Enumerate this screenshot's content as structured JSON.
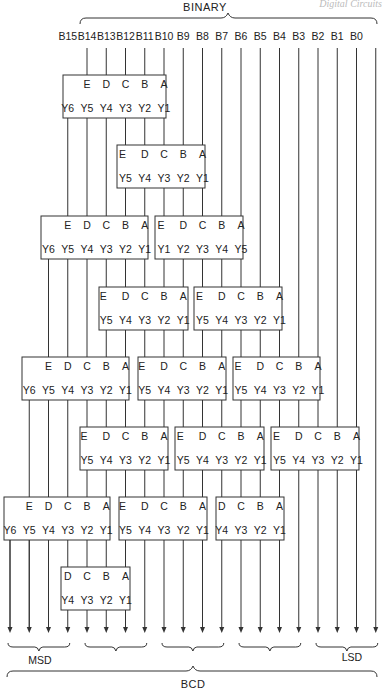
{
  "header": {
    "corner_text": "Digital Circuits",
    "top_brace_label": "BINARY",
    "bottom_brace_label": "BCD",
    "msd_label": "MSD",
    "lsd_label": "LSD"
  },
  "inputs": [
    "B15",
    "B14",
    "B13",
    "B12",
    "B11",
    "B10",
    "B9",
    "B8",
    "B7",
    "B6",
    "B5",
    "B4",
    "B3",
    "B2",
    "B1",
    "B0"
  ],
  "blocks": [
    {
      "id": "r1-a",
      "row": 1,
      "inputs": [
        "E",
        "D",
        "C",
        "B",
        "A"
      ],
      "outputs": [
        "Y6",
        "Y5",
        "Y4",
        "Y3",
        "Y2",
        "Y1"
      ]
    },
    {
      "id": "r2-a",
      "row": 2,
      "inputs": [
        "E",
        "D",
        "C",
        "B",
        "A"
      ],
      "outputs": [
        "Y5",
        "Y4",
        "Y3",
        "Y2",
        "Y1"
      ]
    },
    {
      "id": "r3-a",
      "row": 3,
      "inputs": [
        "E",
        "D",
        "C",
        "B",
        "A"
      ],
      "outputs": [
        "Y6",
        "Y5",
        "Y4",
        "Y3",
        "Y2",
        "Y1"
      ]
    },
    {
      "id": "r3-b",
      "row": 3,
      "inputs": [
        "E",
        "D",
        "C",
        "B",
        "A"
      ],
      "outputs": [
        "Y1",
        "Y2",
        "Y3",
        "Y4",
        "Y5"
      ]
    },
    {
      "id": "r4-a",
      "row": 4,
      "inputs": [
        "E",
        "D",
        "C",
        "B",
        "A"
      ],
      "outputs": [
        "Y5",
        "Y4",
        "Y3",
        "Y2",
        "Y1"
      ]
    },
    {
      "id": "r4-b",
      "row": 4,
      "inputs": [
        "E",
        "D",
        "C",
        "B",
        "A"
      ],
      "outputs": [
        "Y5",
        "Y4",
        "Y3",
        "Y2",
        "Y1"
      ]
    },
    {
      "id": "r5-a",
      "row": 5,
      "inputs": [
        "E",
        "D",
        "C",
        "B",
        "A"
      ],
      "outputs": [
        "Y6",
        "Y5",
        "Y4",
        "Y3",
        "Y2",
        "Y1"
      ]
    },
    {
      "id": "r5-b",
      "row": 5,
      "inputs": [
        "E",
        "D",
        "C",
        "B",
        "A"
      ],
      "outputs": [
        "Y5",
        "Y4",
        "Y3",
        "Y2",
        "Y1"
      ]
    },
    {
      "id": "r5-c",
      "row": 5,
      "inputs": [
        "E",
        "D",
        "C",
        "B",
        "A"
      ],
      "outputs": [
        "Y5",
        "Y4",
        "Y3",
        "Y2",
        "Y1"
      ]
    },
    {
      "id": "r6-a",
      "row": 6,
      "inputs": [
        "E",
        "D",
        "C",
        "B",
        "A"
      ],
      "outputs": [
        "Y5",
        "Y4",
        "Y3",
        "Y2",
        "Y1"
      ]
    },
    {
      "id": "r6-b",
      "row": 6,
      "inputs": [
        "E",
        "D",
        "C",
        "B",
        "A"
      ],
      "outputs": [
        "Y5",
        "Y4",
        "Y3",
        "Y2",
        "Y1"
      ]
    },
    {
      "id": "r6-c",
      "row": 6,
      "inputs": [
        "E",
        "D",
        "C",
        "B",
        "A"
      ],
      "outputs": [
        "Y5",
        "Y4",
        "Y3",
        "Y2",
        "Y1"
      ]
    },
    {
      "id": "r7-a",
      "row": 7,
      "inputs": [
        "E",
        "D",
        "C",
        "B",
        "A"
      ],
      "outputs": [
        "Y6",
        "Y5",
        "Y4",
        "Y3",
        "Y2",
        "Y1"
      ]
    },
    {
      "id": "r7-b",
      "row": 7,
      "inputs": [
        "E",
        "D",
        "C",
        "B",
        "A"
      ],
      "outputs": [
        "Y5",
        "Y4",
        "Y3",
        "Y2",
        "Y1"
      ]
    },
    {
      "id": "r7-c",
      "row": 7,
      "inputs": [
        "D",
        "C",
        "B",
        "A"
      ],
      "outputs": [
        "Y4",
        "Y3",
        "Y2",
        "Y1"
      ]
    },
    {
      "id": "r8-a",
      "row": 8,
      "inputs": [
        "D",
        "C",
        "B",
        "A"
      ],
      "outputs": [
        "Y4",
        "Y3",
        "Y2",
        "Y1"
      ]
    }
  ],
  "output_groups": [
    "MSD",
    "",
    "",
    "",
    "LSD"
  ]
}
